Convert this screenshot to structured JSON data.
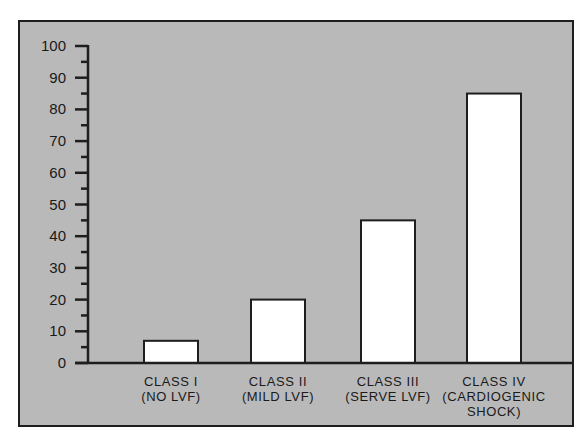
{
  "chart_data": {
    "type": "bar",
    "title": "",
    "xlabel": "",
    "ylabel": "",
    "ylim": [
      0,
      100
    ],
    "yticks": [
      0,
      10,
      20,
      30,
      40,
      50,
      60,
      70,
      80,
      90,
      100
    ],
    "minor_yticks_step": 5,
    "grid": false,
    "legend": null,
    "categories": [
      [
        "CLASS I",
        "(NO LVF)"
      ],
      [
        "CLASS II",
        "(MILD LVF)"
      ],
      [
        "CLASS III",
        "(SERVE LVF)"
      ],
      [
        "CLASS IV",
        "(CARDIOGENIC",
        "SHOCK)"
      ]
    ],
    "values": [
      7,
      20,
      45,
      85
    ],
    "colors": {
      "background": "#b9b9b9",
      "bar_fill": "#ffffff",
      "bar_stroke": "#1e1e1e",
      "axis": "#1e1e1e",
      "page": "#ffffff"
    }
  }
}
